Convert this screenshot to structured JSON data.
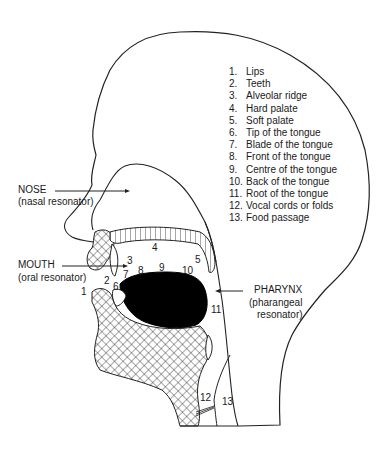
{
  "diagram": {
    "legend": [
      {
        "n": "1.",
        "label": "Lips"
      },
      {
        "n": "2.",
        "label": "Teeth"
      },
      {
        "n": "3.",
        "label": "Alveolar ridge"
      },
      {
        "n": "4.",
        "label": "Hard palate"
      },
      {
        "n": "5.",
        "label": "Soft palate"
      },
      {
        "n": "6.",
        "label": "Tip of the tongue"
      },
      {
        "n": "7.",
        "label": "Blade of the tongue"
      },
      {
        "n": "8.",
        "label": "Front of the tongue"
      },
      {
        "n": "9.",
        "label": "Centre of the tongue"
      },
      {
        "n": "10.",
        "label": "Back of the tongue"
      },
      {
        "n": "11.",
        "label": "Root of the tongue"
      },
      {
        "n": "12.",
        "label": "Vocal cords or folds"
      },
      {
        "n": "13.",
        "label": "Food passage"
      }
    ],
    "resonators": {
      "nose": {
        "name": "NOSE",
        "desc": "(nasal resonator)"
      },
      "mouth": {
        "name": "MOUTH",
        "desc": "(oral resonator)"
      },
      "pharynx": {
        "name": "PHARYNX",
        "desc1": "(pharangeal",
        "desc2": "resonator)"
      }
    },
    "markers": [
      "1",
      "2",
      "3",
      "4",
      "5",
      "6",
      "7",
      "8",
      "9",
      "10",
      "11",
      "12",
      "13"
    ]
  }
}
